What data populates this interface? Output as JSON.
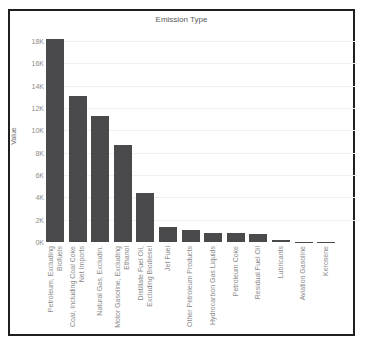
{
  "window": {
    "background": "#ffffff",
    "frame_border_color": "#1f1f1f"
  },
  "chart_data": {
    "type": "bar",
    "title": "Emission Type",
    "xlabel": "",
    "ylabel": "Value",
    "bar_color": "#4a4a4d",
    "grid": true,
    "legend": false,
    "ylim": [
      0,
      19000
    ],
    "y_ticks": [
      {
        "value": 0,
        "label": "0K"
      },
      {
        "value": 2000,
        "label": "2K"
      },
      {
        "value": 4000,
        "label": "4K"
      },
      {
        "value": 6000,
        "label": "6K"
      },
      {
        "value": 8000,
        "label": "8K"
      },
      {
        "value": 10000,
        "label": "10K"
      },
      {
        "value": 12000,
        "label": "12K"
      },
      {
        "value": 14000,
        "label": "14K"
      },
      {
        "value": 16000,
        "label": "16K"
      },
      {
        "value": 18000,
        "label": "18K"
      }
    ],
    "categories": [
      "Petroleum, Excluding Biofuels",
      "Coal, Including Coal Coke Net Imports",
      "Natural Gas, Excludin.",
      "Motor Gasoline, Excluding Ethanol",
      "Distillate Fuel Oil, Excluding Biodiesel",
      "Jet Fuel",
      "Other Petroleum Products",
      "Hydrocarbon Gas Liquids",
      "Petroleum Coke",
      "Residual Fuel Oil",
      "Lubricants",
      "Aviation Gasoline",
      "Kerosene"
    ],
    "category_lines": [
      [
        "Petroleum, Excluding",
        "Biofuels"
      ],
      [
        "Coal, Including Coal Coke",
        "Net Imports"
      ],
      [
        "Natural Gas, Excludin."
      ],
      [
        "Motor Gasoline, Excluding",
        "Ethanol"
      ],
      [
        "Distillate Fuel Oil,",
        "Excluding Biodiesel"
      ],
      [
        "Jet Fuel"
      ],
      [
        "Other Petroleum Products"
      ],
      [
        "Hydrocarbon Gas Liquids"
      ],
      [
        "Petroleum Coke"
      ],
      [
        "Residual Fuel Oil"
      ],
      [
        "Lubricants"
      ],
      [
        "Aviation Gasoline"
      ],
      [
        "Kerosene"
      ]
    ],
    "values": [
      18200,
      13100,
      11250,
      8700,
      4350,
      1300,
      1050,
      800,
      850,
      700,
      180,
      40,
      20
    ]
  }
}
